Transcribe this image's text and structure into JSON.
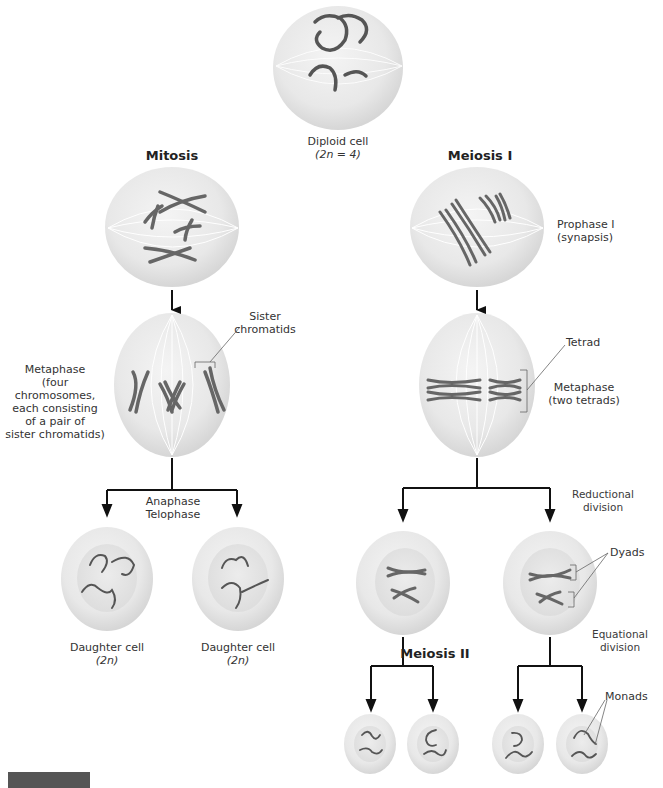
{
  "titles": {
    "mitosis": "Mitosis",
    "meiosis1": "Meiosis I",
    "meiosis2": "Meiosis II"
  },
  "labels": {
    "diploid_line1": "Diploid cell",
    "diploid_line2": "(2n = 4)",
    "prophase1_line1": "Prophase I",
    "prophase1_line2": "(synapsis)",
    "sister_line1": "Sister",
    "sister_line2": "chromatids",
    "metaphase_mitosis": [
      "Metaphase",
      "(four chromosomes,",
      "each consisting",
      "of a pair of",
      "sister chromatids)"
    ],
    "tetrad": "Tetrad",
    "metaphase_meiosis_line1": "Metaphase",
    "metaphase_meiosis_line2": "(two tetrads)",
    "anaphase": "Anaphase",
    "telophase": "Telophase",
    "reductional_line1": "Reductional",
    "reductional_line2": "division",
    "dyads": "Dyads",
    "equational_line1": "Equational",
    "equational_line2": "division",
    "monads": "Monads",
    "daughter1_line1": "Daughter cell",
    "daughter1_line2": "(2n)",
    "daughter2_line1": "Daughter cell",
    "daughter2_line2": "(2n)"
  },
  "colors": {
    "cell_fill": "#ebebeb",
    "cell_edge": "#d4d4d4",
    "chromosome": "#5a5a5a",
    "arrow": "#111111"
  }
}
